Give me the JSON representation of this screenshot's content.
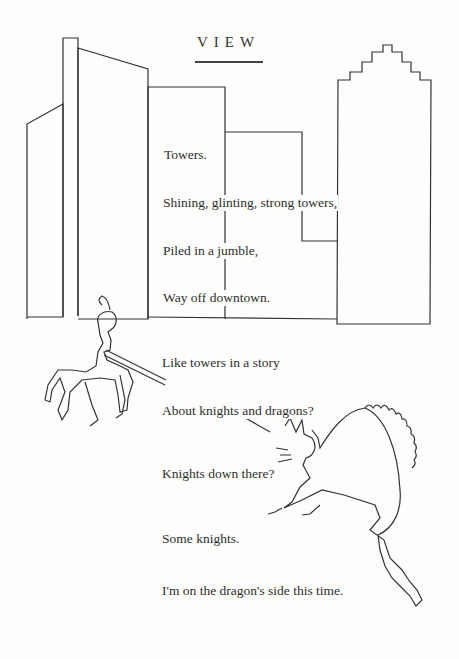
{
  "poem": {
    "title": "VIEW",
    "lines": [
      "Towers.",
      "Shining, glinting, strong towers,",
      "Piled in a jumble,",
      "Way off downtown.",
      "Like towers in a story",
      "About knights and dragons?",
      "Knights down there?",
      "Some knights.",
      "I'm on the dragon's side this time."
    ]
  },
  "illustrations": {
    "skyline": "city-towers-outline",
    "knight": "knight-on-horse-with-lance",
    "dragon": "dragon-with-spiked-back"
  }
}
